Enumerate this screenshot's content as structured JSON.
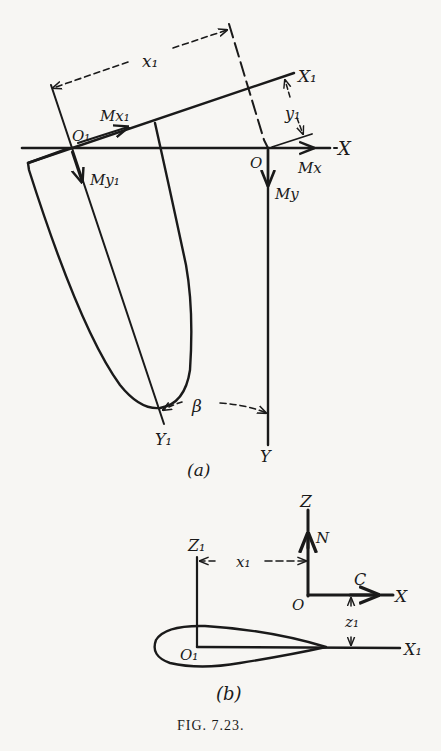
{
  "figure": {
    "caption": "Fig. 7.23.",
    "caption_smallcaps": "FIG. 7.23."
  },
  "part_a": {
    "sublabel": "(a)",
    "labels": {
      "x1_dim": "x₁",
      "X1_axis": "X₁",
      "y1_dim": "y₁",
      "O1": "O₁",
      "Mx1": "Mx₁",
      "My1": "My₁",
      "O": "O",
      "X_axis": "X",
      "Mx": "Mx",
      "My": "My",
      "beta": "β",
      "Y1_axis": "Y₁",
      "Y_axis": "Y"
    }
  },
  "part_b": {
    "sublabel": "(b)",
    "labels": {
      "Z_axis": "Z",
      "N": "N",
      "Z1_axis": "Z₁",
      "x1_dim": "x₁",
      "C": "C",
      "O": "O",
      "X_axis": "X",
      "z1_dim": "z₁",
      "O1": "O₁",
      "X1_axis": "X₁"
    }
  },
  "colors": {
    "ink": "#1a1a1a",
    "paper": "#f7f6f3"
  }
}
